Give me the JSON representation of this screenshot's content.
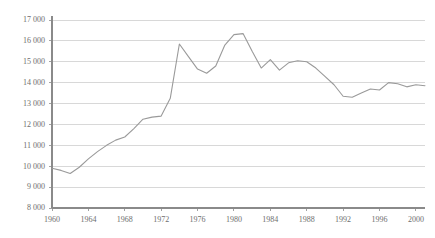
{
  "chart_data": {
    "type": "line",
    "title": "",
    "subtitle": "",
    "xlabel": "",
    "ylabel": "",
    "xlim": [
      1960,
      2001
    ],
    "ylim": [
      8000,
      17000
    ],
    "grid": true,
    "legend_position": "none",
    "y_ticks": [
      8000,
      9000,
      10000,
      11000,
      12000,
      13000,
      14000,
      15000,
      16000,
      17000
    ],
    "y_tick_labels": [
      "8 000",
      "9 000",
      "10 000",
      "11 000",
      "12 000",
      "13 000",
      "14 000",
      "15 000",
      "16 000",
      "17 000"
    ],
    "x_ticks": [
      1960,
      1964,
      1968,
      1972,
      1976,
      1980,
      1984,
      1988,
      1992,
      1996,
      2000
    ],
    "x_tick_labels": [
      "1960",
      "1964",
      "1968",
      "1972",
      "1976",
      "1980",
      "1984",
      "1988",
      "1992",
      "1996",
      "2000"
    ],
    "thousands_separator": " ",
    "line_color": "#9a9a9a",
    "grid_color": "#c8c8c8",
    "axis_color": "#8a8a8a",
    "label_color": "#6e6e6e",
    "background_color": "#ffffff",
    "series": [
      {
        "name": "value",
        "x": [
          1960,
          1961,
          1962,
          1963,
          1964,
          1965,
          1966,
          1967,
          1968,
          1969,
          1970,
          1971,
          1972,
          1973,
          1974,
          1975,
          1976,
          1977,
          1978,
          1979,
          1980,
          1981,
          1982,
          1983,
          1984,
          1985,
          1986,
          1987,
          1988,
          1989,
          1990,
          1991,
          1992,
          1993,
          1994,
          1995,
          1996,
          1997,
          1998,
          1999,
          2000,
          2001
        ],
        "values": [
          9900,
          9800,
          9650,
          9950,
          10350,
          10700,
          11000,
          11250,
          11400,
          11800,
          12250,
          12350,
          12400,
          13250,
          15850,
          15250,
          14650,
          14450,
          14800,
          15800,
          16300,
          16350,
          15500,
          14700,
          15100,
          14600,
          14950,
          15050,
          15000,
          14700,
          14300,
          13900,
          13350,
          13300,
          13500,
          13700,
          13650,
          14000,
          13950,
          13800,
          13900,
          13850
        ]
      }
    ]
  },
  "axes": {
    "y_axis_name": "value-axis",
    "x_axis_name": "year-axis"
  }
}
